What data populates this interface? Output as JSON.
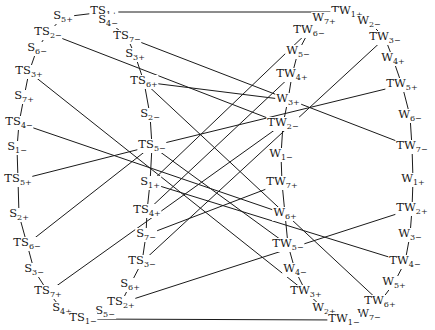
{
  "diagram": {
    "type": "graph",
    "stroke_color": "#1a1a1a",
    "nodes": [
      {
        "id": "TS1+",
        "base": "TS",
        "sub": "1+",
        "x": 104,
        "y": 12
      },
      {
        "id": "S5+",
        "base": "S",
        "sub": "5+",
        "x": 63,
        "y": 17
      },
      {
        "id": "S4-",
        "base": "S",
        "sub": "4−",
        "x": 108,
        "y": 21
      },
      {
        "id": "TS2-",
        "base": "TS",
        "sub": "2−",
        "x": 48,
        "y": 33
      },
      {
        "id": "TS7-",
        "base": "TS",
        "sub": "7−",
        "x": 127,
        "y": 37
      },
      {
        "id": "S6-",
        "base": "S",
        "sub": "6−",
        "x": 37,
        "y": 49
      },
      {
        "id": "S3+",
        "base": "S",
        "sub": "3+",
        "x": 135,
        "y": 55
      },
      {
        "id": "TS3+",
        "base": "TS",
        "sub": "3+",
        "x": 29,
        "y": 72
      },
      {
        "id": "TS6+",
        "base": "TS",
        "sub": "6+",
        "x": 144,
        "y": 82
      },
      {
        "id": "S7+",
        "base": "S",
        "sub": "7+",
        "x": 24,
        "y": 97
      },
      {
        "id": "S2-",
        "base": "S",
        "sub": "2−",
        "x": 150,
        "y": 115
      },
      {
        "id": "TS4-",
        "base": "TS",
        "sub": "4−",
        "x": 19,
        "y": 123
      },
      {
        "id": "TS5-",
        "base": "TS",
        "sub": "5−",
        "x": 152,
        "y": 146
      },
      {
        "id": "S1-",
        "base": "S",
        "sub": "1−",
        "x": 17,
        "y": 148
      },
      {
        "id": "TS5+",
        "base": "TS",
        "sub": "5+",
        "x": 18,
        "y": 180
      },
      {
        "id": "S1+",
        "base": "S",
        "sub": "1+",
        "x": 150,
        "y": 183
      },
      {
        "id": "S2+",
        "base": "S",
        "sub": "2+",
        "x": 19,
        "y": 215
      },
      {
        "id": "TS4+",
        "base": "TS",
        "sub": "4+",
        "x": 147,
        "y": 211
      },
      {
        "id": "S7-",
        "base": "S",
        "sub": "7−",
        "x": 146,
        "y": 235
      },
      {
        "id": "TS6-",
        "base": "TS",
        "sub": "6−",
        "x": 27,
        "y": 244
      },
      {
        "id": "TS3-",
        "base": "TS",
        "sub": "3−",
        "x": 142,
        "y": 262
      },
      {
        "id": "S3-",
        "base": "S",
        "sub": "3−",
        "x": 34,
        "y": 270
      },
      {
        "id": "S6+",
        "base": "S",
        "sub": "6+",
        "x": 130,
        "y": 285
      },
      {
        "id": "TS7+",
        "base": "TS",
        "sub": "7+",
        "x": 48,
        "y": 292
      },
      {
        "id": "TS2+",
        "base": "TS",
        "sub": "2+",
        "x": 121,
        "y": 303
      },
      {
        "id": "S4+",
        "base": "S",
        "sub": "4+",
        "x": 62,
        "y": 309
      },
      {
        "id": "S5-",
        "base": "S",
        "sub": "5−",
        "x": 105,
        "y": 312
      },
      {
        "id": "TS1-",
        "base": "TS",
        "sub": "1−",
        "x": 83,
        "y": 319
      },
      {
        "id": "TW1+",
        "base": "TW",
        "sub": "1+",
        "x": 347,
        "y": 12
      },
      {
        "id": "W7+",
        "base": "W",
        "sub": "7+",
        "x": 324,
        "y": 19
      },
      {
        "id": "W2-",
        "base": "W",
        "sub": "2−",
        "x": 369,
        "y": 22
      },
      {
        "id": "TW6-",
        "base": "TW",
        "sub": "6−",
        "x": 309,
        "y": 31
      },
      {
        "id": "TW3-",
        "base": "TW",
        "sub": "3−",
        "x": 385,
        "y": 38
      },
      {
        "id": "W5-",
        "base": "W",
        "sub": "5−",
        "x": 298,
        "y": 52
      },
      {
        "id": "W4+",
        "base": "W",
        "sub": "4+",
        "x": 393,
        "y": 59
      },
      {
        "id": "TW4+",
        "base": "TW",
        "sub": "4+",
        "x": 292,
        "y": 75
      },
      {
        "id": "TW5+",
        "base": "TW",
        "sub": "5+",
        "x": 402,
        "y": 85
      },
      {
        "id": "W3+",
        "base": "W",
        "sub": "3+",
        "x": 288,
        "y": 100
      },
      {
        "id": "W6-",
        "base": "W",
        "sub": "6−",
        "x": 410,
        "y": 116
      },
      {
        "id": "TW2-",
        "base": "TW",
        "sub": "2−",
        "x": 283,
        "y": 124
      },
      {
        "id": "W1-",
        "base": "W",
        "sub": "1−",
        "x": 281,
        "y": 155
      },
      {
        "id": "TW7-",
        "base": "TW",
        "sub": "7−",
        "x": 412,
        "y": 147
      },
      {
        "id": "W1+",
        "base": "W",
        "sub": "1+",
        "x": 413,
        "y": 180
      },
      {
        "id": "TW7+",
        "base": "TW",
        "sub": "7+",
        "x": 282,
        "y": 183
      },
      {
        "id": "TW2+",
        "base": "TW",
        "sub": "2+",
        "x": 412,
        "y": 209
      },
      {
        "id": "W6+",
        "base": "W",
        "sub": "6+",
        "x": 285,
        "y": 214
      },
      {
        "id": "TW5-",
        "base": "TW",
        "sub": "5−",
        "x": 288,
        "y": 245
      },
      {
        "id": "W3-",
        "base": "W",
        "sub": "3−",
        "x": 410,
        "y": 235
      },
      {
        "id": "TW4-",
        "base": "TW",
        "sub": "4−",
        "x": 405,
        "y": 262
      },
      {
        "id": "W4-",
        "base": "W",
        "sub": "4−",
        "x": 295,
        "y": 270
      },
      {
        "id": "W5+",
        "base": "W",
        "sub": "5+",
        "x": 394,
        "y": 283
      },
      {
        "id": "TW3+",
        "base": "TW",
        "sub": "3+",
        "x": 306,
        "y": 292
      },
      {
        "id": "TW6+",
        "base": "TW",
        "sub": "6+",
        "x": 380,
        "y": 302
      },
      {
        "id": "W2+",
        "base": "W",
        "sub": "2+",
        "x": 324,
        "y": 309
      },
      {
        "id": "W7-",
        "base": "W",
        "sub": "7−",
        "x": 369,
        "y": 315
      },
      {
        "id": "TW1-",
        "base": "TW",
        "sub": "1−",
        "x": 344,
        "y": 320
      }
    ],
    "edges": [
      [
        "TS1+",
        "S5+"
      ],
      [
        "S5+",
        "TS2-"
      ],
      [
        "TS2-",
        "S6-"
      ],
      [
        "S6-",
        "TS3+"
      ],
      [
        "TS3+",
        "S7+"
      ],
      [
        "S7+",
        "TS4-"
      ],
      [
        "TS4-",
        "S1-"
      ],
      [
        "S1-",
        "TS5+"
      ],
      [
        "TS5+",
        "S2+"
      ],
      [
        "S2+",
        "TS6-"
      ],
      [
        "TS6-",
        "S3-"
      ],
      [
        "S3-",
        "TS7+"
      ],
      [
        "TS7+",
        "S4+"
      ],
      [
        "S4+",
        "TS1-"
      ],
      [
        "TS1+",
        "S4-"
      ],
      [
        "S4-",
        "TS7-"
      ],
      [
        "TS7-",
        "S3+"
      ],
      [
        "S3+",
        "TS6+"
      ],
      [
        "TS6+",
        "S2-"
      ],
      [
        "S2-",
        "TS5-"
      ],
      [
        "TS5-",
        "S1+"
      ],
      [
        "S1+",
        "TS4+"
      ],
      [
        "TS4+",
        "S7-"
      ],
      [
        "S7-",
        "TS3-"
      ],
      [
        "TS3-",
        "S6+"
      ],
      [
        "S6+",
        "TS2+"
      ],
      [
        "TS2+",
        "S5-"
      ],
      [
        "S5-",
        "TS1-"
      ],
      [
        "TW1+",
        "W7+"
      ],
      [
        "W7+",
        "TW6-"
      ],
      [
        "TW6-",
        "W5-"
      ],
      [
        "W5-",
        "TW4+"
      ],
      [
        "TW4+",
        "W3+"
      ],
      [
        "W3+",
        "TW2-"
      ],
      [
        "TW2-",
        "W1-"
      ],
      [
        "W1-",
        "TW7+"
      ],
      [
        "TW7+",
        "W6+"
      ],
      [
        "W6+",
        "TW5-"
      ],
      [
        "TW5-",
        "W4-"
      ],
      [
        "W4-",
        "TW3+"
      ],
      [
        "TW3+",
        "W2+"
      ],
      [
        "W2+",
        "TW1-"
      ],
      [
        "TW1+",
        "W2-"
      ],
      [
        "W2-",
        "TW3-"
      ],
      [
        "TW3-",
        "W4+"
      ],
      [
        "W4+",
        "TW5+"
      ],
      [
        "TW5+",
        "W6-"
      ],
      [
        "W6-",
        "TW7-"
      ],
      [
        "TW7-",
        "W1+"
      ],
      [
        "W1+",
        "TW2+"
      ],
      [
        "TW2+",
        "W3-"
      ],
      [
        "W3-",
        "TW4-"
      ],
      [
        "TW4-",
        "W5+"
      ],
      [
        "W5+",
        "TW6+"
      ],
      [
        "TW6+",
        "W7-"
      ],
      [
        "W7-",
        "TW1-"
      ],
      [
        "TS1+",
        "TW1+"
      ],
      [
        "TS1-",
        "TW1-"
      ],
      [
        "TS2-",
        "TW2-"
      ],
      [
        "TS7-",
        "TW7-"
      ],
      [
        "TS3+",
        "TW3+"
      ],
      [
        "TS4-",
        "W6+"
      ],
      [
        "TS5+",
        "TS5-"
      ],
      [
        "TS5-",
        "TW5+"
      ],
      [
        "TS6+",
        "TW6+"
      ],
      [
        "TS6-",
        "TS5-"
      ],
      [
        "TS7+",
        "TW2-"
      ],
      [
        "TS2+",
        "TW2+"
      ],
      [
        "TS3-",
        "TW3-"
      ],
      [
        "TS4+",
        "TW4+"
      ],
      [
        "TS5-",
        "TW5-"
      ],
      [
        "S1+",
        "TW6-"
      ],
      [
        "S7-",
        "TW7+"
      ],
      [
        "S1+",
        "TW4-"
      ],
      [
        "TS6+",
        "W3+"
      ]
    ]
  }
}
